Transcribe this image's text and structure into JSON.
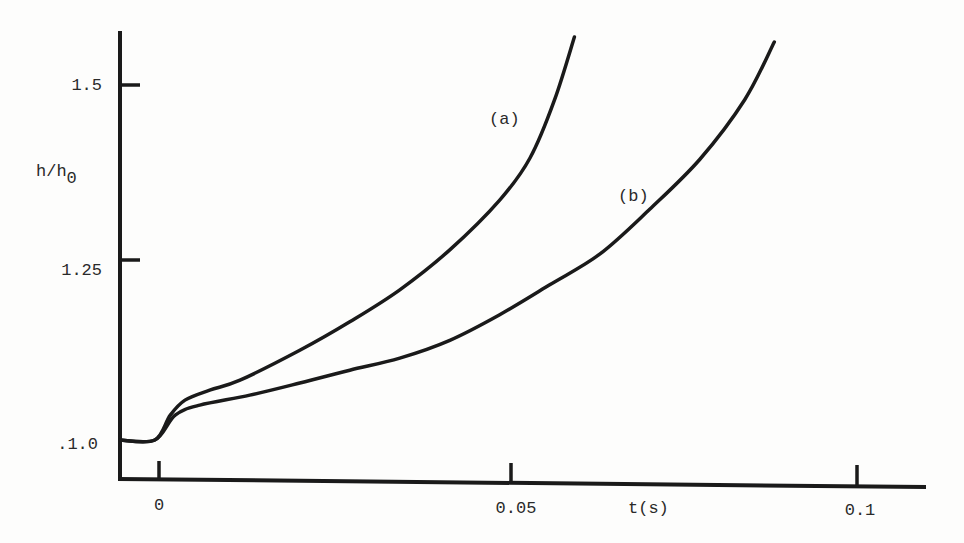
{
  "chart_data": {
    "type": "line",
    "title": "",
    "xlabel": "t(s)",
    "ylabel": "h/h0",
    "ylabel_main": "h/h",
    "ylabel_sub": "0",
    "xlim": [
      -0.0055,
      0.117
    ],
    "ylim": [
      0.95,
      1.59
    ],
    "grid": false,
    "legend": "inline curve labels",
    "x_ticks": [
      {
        "value": 0,
        "label": "0"
      },
      {
        "value": 0.05,
        "label": "0.05"
      },
      {
        "value": 0.1,
        "label": "0.1"
      }
    ],
    "y_ticks": [
      {
        "value": 1.0,
        "label": ".1.0"
      },
      {
        "value": 1.25,
        "label": "1.25"
      },
      {
        "value": 1.5,
        "label": "1.5"
      }
    ],
    "series": [
      {
        "name": "(a)",
        "label": "(a)",
        "color": "#1a1a1a",
        "x": [
          -0.0055,
          -0.0006,
          0.0016,
          0.0037,
          0.0072,
          0.0115,
          0.02,
          0.0271,
          0.0342,
          0.0413,
          0.0484,
          0.0527,
          0.0562,
          0.059
        ],
        "y": [
          1.0,
          1.0,
          1.035,
          1.056,
          1.07,
          1.084,
          1.126,
          1.166,
          1.211,
          1.267,
          1.337,
          1.396,
          1.478,
          1.566
        ]
      },
      {
        "name": "(b)",
        "label": "(b)",
        "color": "#1a1a1a",
        "x": [
          -0.0055,
          -0.0006,
          0.0023,
          0.0058,
          0.0129,
          0.02,
          0.0271,
          0.0342,
          0.0413,
          0.0484,
          0.0555,
          0.0626,
          0.0697,
          0.0768,
          0.0832,
          0.0874
        ],
        "y": [
          1.0,
          1.0,
          1.035,
          1.049,
          1.063,
          1.08,
          1.098,
          1.115,
          1.14,
          1.176,
          1.218,
          1.261,
          1.324,
          1.394,
          1.478,
          1.559
        ]
      }
    ]
  },
  "labels": {
    "series_a": "(a)",
    "series_b": "(b)"
  },
  "colors": {
    "ink": "#1a1a1a",
    "text": "#2a2a2a",
    "paper": "#fdfdfc"
  }
}
